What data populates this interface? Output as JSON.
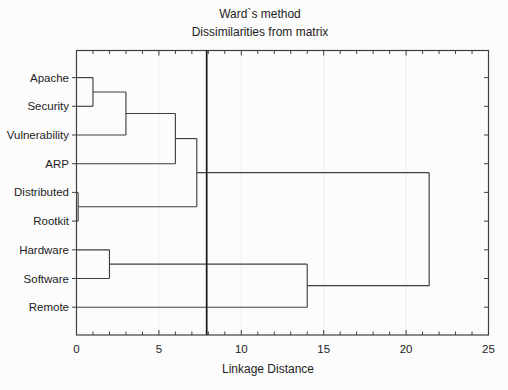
{
  "chart_data": {
    "type": "dendrogram",
    "orientation": "horizontal",
    "title": "Ward`s method",
    "subtitle": "Dissimilarities from matrix",
    "xlabel": "Linkage Distance",
    "xlim": [
      0,
      25
    ],
    "x_major_ticks": [
      "0",
      "5",
      "10",
      "15",
      "20",
      "25"
    ],
    "x_major_tick_values": [
      0,
      5,
      10,
      15,
      20,
      25
    ],
    "x_minor_tick_step": 1,
    "grid": "very faint vertical lines at major ticks",
    "legend": "none",
    "leaves": [
      "Apache",
      "Security",
      "Vulnerability",
      "ARP",
      "Distributed",
      "Rootkit",
      "Hardware",
      "Software",
      "Remote"
    ],
    "merges": [
      {
        "id": "c1",
        "left": "Apache",
        "right": "Security",
        "distance": 1.0
      },
      {
        "id": "c2",
        "left": "c1",
        "right": "Vulnerability",
        "distance": 3.0
      },
      {
        "id": "c3",
        "left": "c2",
        "right": "ARP",
        "distance": 6.0
      },
      {
        "id": "c4",
        "left": "Distributed",
        "right": "Rootkit",
        "distance": 0.1
      },
      {
        "id": "c5",
        "left": "c3",
        "right": "c4",
        "distance": 7.3
      },
      {
        "id": "c6",
        "left": "Hardware",
        "right": "Software",
        "distance": 2.0
      },
      {
        "id": "c7",
        "left": "c6",
        "right": "Remote",
        "distance": 14.0
      },
      {
        "id": "c8",
        "left": "c5",
        "right": "c7",
        "distance": 21.4
      }
    ],
    "cut_line_value": 7.9,
    "colors": {
      "line": "#3f3f3f",
      "frame": "#3f3f3f",
      "cut_line": "#151515",
      "text": "#1c1c1c",
      "grid": "#ededed",
      "background": "#fcfcfc"
    }
  }
}
